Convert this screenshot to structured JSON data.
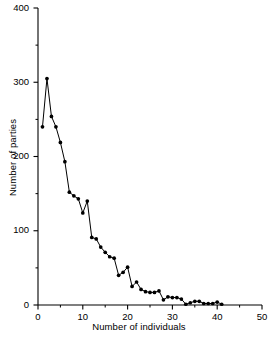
{
  "figure": {
    "background": "#ffffff",
    "foreground": "#000000"
  },
  "chart_data": {
    "type": "line",
    "title": "",
    "xlabel": "Number of individuals",
    "ylabel": "Number of parties",
    "xlim": [
      0,
      50
    ],
    "ylim": [
      0,
      400
    ],
    "xticks": [
      0,
      10,
      20,
      30,
      40,
      50
    ],
    "xtick_labels": [
      "0",
      "10",
      "20",
      "30",
      "40",
      "50"
    ],
    "xminor_ticks": [
      5,
      15,
      25,
      35,
      45
    ],
    "yticks": [
      0,
      100,
      200,
      300,
      400
    ],
    "ytick_labels": [
      "0",
      "100",
      "200",
      "300",
      "400"
    ],
    "yminor_ticks": [
      50,
      150,
      250,
      350
    ],
    "grid": false,
    "legend": null,
    "marker": "filled-circle",
    "marker_color": "#000000",
    "line_color": "#000000",
    "x": [
      1,
      2,
      3,
      4,
      5,
      6,
      7,
      8,
      9,
      10,
      11,
      12,
      13,
      14,
      15,
      16,
      17,
      18,
      19,
      20,
      21,
      22,
      23,
      24,
      25,
      26,
      27,
      28,
      29,
      30,
      31,
      32,
      33,
      34,
      35,
      36,
      37,
      38,
      39,
      40,
      41
    ],
    "y": [
      240,
      305,
      254,
      240,
      219,
      193,
      152,
      147,
      143,
      124,
      140,
      91,
      89,
      78,
      71,
      65,
      63,
      40,
      44,
      51,
      25,
      31,
      21,
      18,
      17,
      17,
      19,
      7,
      11,
      10,
      10,
      8,
      1,
      3,
      5,
      5,
      2,
      2,
      2,
      4,
      1
    ]
  }
}
